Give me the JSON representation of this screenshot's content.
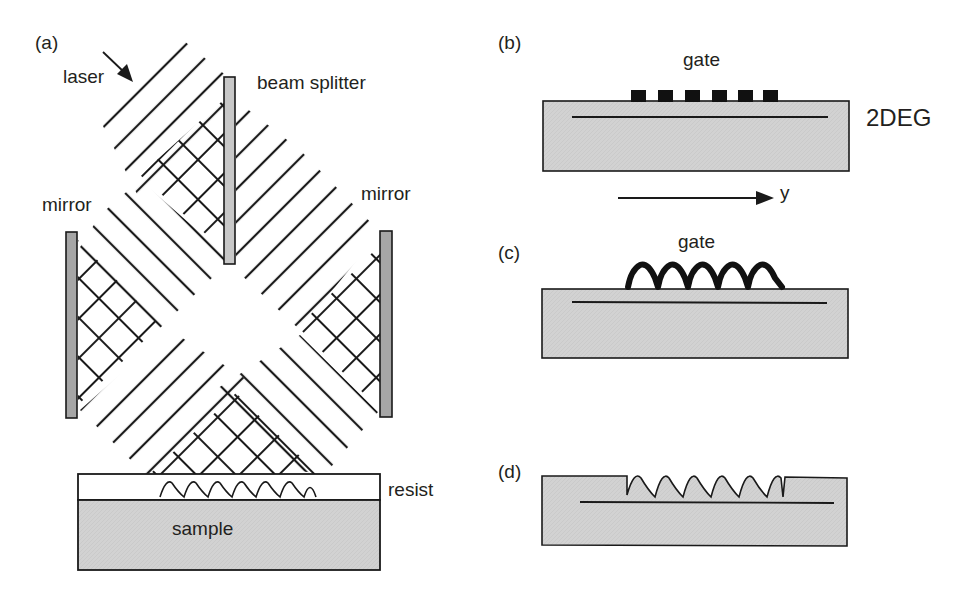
{
  "figure": {
    "panels": [
      {
        "id": "a",
        "label": "(a)",
        "description": "Holographic interference lithography setup"
      },
      {
        "id": "b",
        "label": "(b)",
        "description": "Periodic gate structure on 2DEG heterostructure"
      },
      {
        "id": "c",
        "label": "(c)",
        "description": "Sinusoidal gate on 2DEG heterostructure"
      },
      {
        "id": "d",
        "label": "(d)",
        "description": "Sinusoidal etched surface above 2DEG"
      }
    ],
    "panel_a": {
      "label": "(a)",
      "laser": "laser",
      "beam_splitter": "beam splitter",
      "mirror_left": "mirror",
      "mirror_right": "mirror",
      "resist": "resist",
      "sample": "sample"
    },
    "panel_b": {
      "label": "(b)",
      "gate": "gate",
      "twodeg": "2DEG",
      "axis": "y",
      "gate_fingers": 6
    },
    "panel_c": {
      "label": "(c)",
      "gate": "gate",
      "periods": 6
    },
    "panel_d": {
      "label": "(d)",
      "periods": 6
    }
  },
  "colors": {
    "line": "#1a1a1a",
    "substrate_fill": "#d2d2d2",
    "mirror_fill": "#a6a6a6",
    "splitter_fill": "#c8c8c8",
    "text": "#231f20"
  }
}
